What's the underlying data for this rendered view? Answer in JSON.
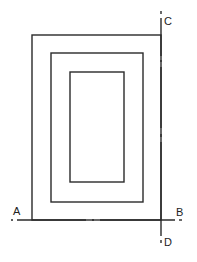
{
  "diagram": {
    "type": "section-view-nested-rectangles",
    "labels": {
      "a": "A",
      "b": "B",
      "c": "C",
      "d": "D"
    },
    "rectangles": [
      {
        "name": "outer",
        "x": 32,
        "y": 35,
        "w": 129,
        "h": 185
      },
      {
        "name": "middle",
        "x": 51,
        "y": 53,
        "w": 92,
        "h": 149
      },
      {
        "name": "inner",
        "x": 70,
        "y": 72,
        "w": 54,
        "h": 110
      }
    ],
    "section_lines": [
      {
        "name": "A-B",
        "orientation": "horizontal",
        "y": 220,
        "from": "A",
        "to": "B"
      },
      {
        "name": "C-D",
        "orientation": "vertical",
        "x": 161,
        "from": "C",
        "to": "D"
      }
    ],
    "colors": {
      "line": "#2a2a2a",
      "background": "#ffffff"
    }
  }
}
